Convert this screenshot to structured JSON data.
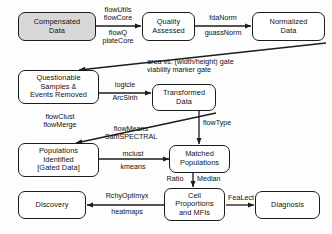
{
  "diagram": {
    "nodes": [
      {
        "id": "compensated",
        "label": "Compensated\nData",
        "shaded": true
      },
      {
        "id": "quality",
        "label": "Quality\nAssessed",
        "shaded": false
      },
      {
        "id": "normalized",
        "label": "Normalized\nData",
        "shaded": false
      },
      {
        "id": "questionable",
        "label": "Questionable\nSamples &\nEvents Removed",
        "shaded": false
      },
      {
        "id": "transformed",
        "label": "Transformed\nData",
        "shaded": false
      },
      {
        "id": "populations",
        "label": "Populations\nIdentified\n[Gated Data]",
        "shaded": false
      },
      {
        "id": "matched",
        "label": "Matched\nPopulations",
        "shaded": false
      },
      {
        "id": "discovery",
        "label": "Discovery",
        "shaded": false
      },
      {
        "id": "cellprop",
        "label": "Cell\nProportions\nand MFIs",
        "shaded": false
      },
      {
        "id": "diagnosis",
        "label": "Diagnosis",
        "shaded": false
      }
    ],
    "edge_labels": [
      {
        "id": "e1_above",
        "text": "flowUtils\nflowCore"
      },
      {
        "id": "e1_below",
        "text": "flowQ\nplateCore"
      },
      {
        "id": "e2_above",
        "text": "fdaNorm"
      },
      {
        "id": "e2_below",
        "text": "guassNorm"
      },
      {
        "id": "e3",
        "text": "area vs. (width/height) gate\nviability marker gate"
      },
      {
        "id": "e4_above",
        "text": "logicle"
      },
      {
        "id": "e4_below",
        "text": "ArcSinh"
      },
      {
        "id": "e5",
        "text": "flowClust\nflowMerge"
      },
      {
        "id": "e6",
        "text": "flowMeans\nSamSPECTRAL"
      },
      {
        "id": "e7",
        "text": "flowType"
      },
      {
        "id": "e8_above",
        "text": "mclust"
      },
      {
        "id": "e8_below",
        "text": "kmeans"
      },
      {
        "id": "e9_left",
        "text": "Ratio"
      },
      {
        "id": "e9_right",
        "text": "Median"
      },
      {
        "id": "e10_above",
        "text": "RchyOptimyx"
      },
      {
        "id": "e10_below",
        "text": "heatmaps"
      },
      {
        "id": "e11",
        "text": "FeaLect"
      }
    ],
    "colors": {
      "stroke": "#1b1b1b",
      "shaded_fill": "#d8d8d8",
      "node_fill": "#ffffff",
      "background": "#fdfdfd",
      "text": "#111111"
    }
  }
}
